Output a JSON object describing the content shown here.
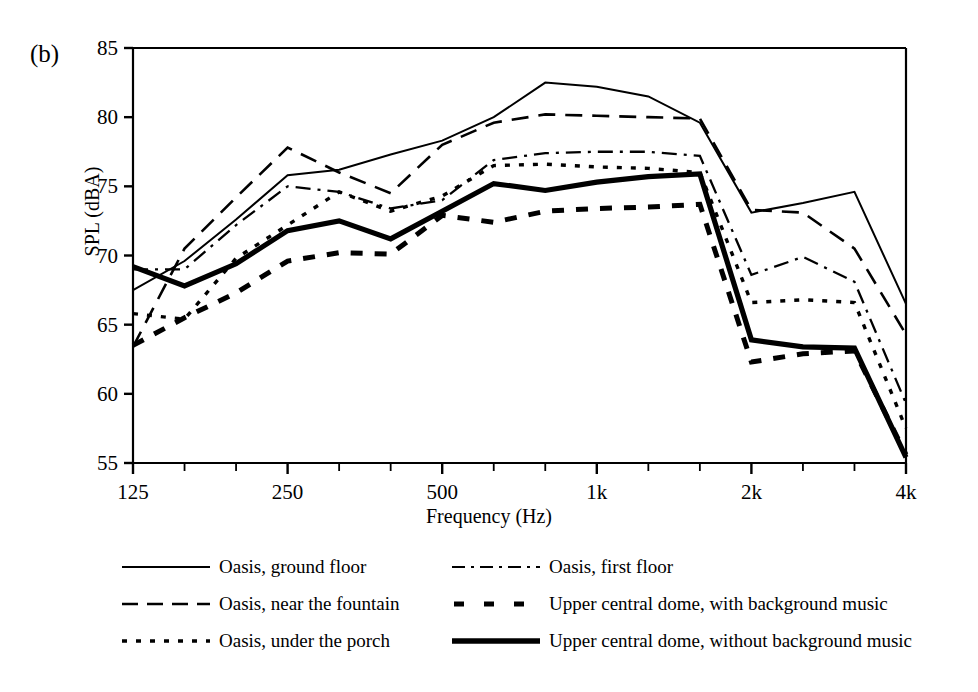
{
  "panel_label": "(b)",
  "chart_data": {
    "type": "line",
    "title": "",
    "xlabel": "Frequency (Hz)",
    "ylabel": "SPL (dBA)",
    "ylim": [
      55,
      85
    ],
    "yticks": [
      55,
      60,
      65,
      70,
      75,
      80,
      85
    ],
    "grid": false,
    "legend_position": "bottom",
    "categories": [
      "125",
      "160",
      "200",
      "250",
      "315",
      "400",
      "500",
      "630",
      "800",
      "1k",
      "1.25k",
      "1.6k",
      "2k",
      "2.5k",
      "3.15k",
      "4k"
    ],
    "xtick_labels": [
      "125",
      "250",
      "500",
      "1k",
      "2k",
      "4k"
    ],
    "xtick_label_indices": [
      0,
      3,
      6,
      9,
      12,
      15
    ],
    "series": [
      {
        "name": "Oasis, ground floor",
        "style": "solid-thin",
        "values": [
          67.5,
          69.6,
          72.6,
          75.8,
          76.2,
          77.3,
          78.3,
          80.0,
          82.5,
          82.2,
          81.5,
          79.6,
          73.1,
          73.8,
          74.6,
          66.5
        ]
      },
      {
        "name": "Oasis, near the fountain",
        "style": "dashed",
        "values": [
          63.4,
          70.5,
          74.2,
          77.8,
          76.0,
          74.5,
          78.0,
          79.6,
          80.2,
          80.1,
          80.0,
          79.9,
          73.3,
          73.1,
          70.5,
          64.3
        ]
      },
      {
        "name": "Oasis, under the porch",
        "style": "dotted",
        "values": [
          65.8,
          65.4,
          69.8,
          72.2,
          74.6,
          73.2,
          74.3,
          76.5,
          76.6,
          76.4,
          76.3,
          76.0,
          66.6,
          66.8,
          66.6,
          57.5
        ]
      },
      {
        "name": "Oasis, first floor",
        "style": "dash-dot",
        "values": [
          69.0,
          69.0,
          72.2,
          75.0,
          74.6,
          73.4,
          74.0,
          76.9,
          77.4,
          77.5,
          77.5,
          77.2,
          68.6,
          69.9,
          68.1,
          59.3
        ]
      },
      {
        "name": "Upper central dome, with background music",
        "style": "dashed-thick",
        "values": [
          63.5,
          65.5,
          67.3,
          69.6,
          70.2,
          70.1,
          72.9,
          72.4,
          73.2,
          73.4,
          73.5,
          73.7,
          62.3,
          62.9,
          63.1,
          55.6
        ]
      },
      {
        "name": "Upper central dome, without background music",
        "style": "solid-thick",
        "values": [
          69.2,
          67.8,
          69.4,
          71.8,
          72.5,
          71.2,
          73.2,
          75.2,
          74.7,
          75.3,
          75.7,
          75.9,
          63.9,
          63.4,
          63.3,
          55.4
        ]
      }
    ]
  }
}
